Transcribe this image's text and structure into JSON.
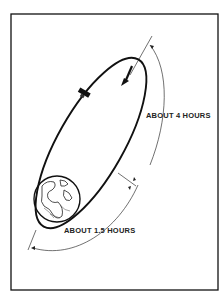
{
  "diagram": {
    "labels": {
      "long_arc": "ABOUT 4 HOURS",
      "short_arc": "ABOUT 1.5 HOURS"
    },
    "elements": {
      "central_body": "earth",
      "vehicle": "spacecraft",
      "orbit": "elliptical-orbit",
      "direction": "arrow-down-left"
    },
    "colors": {
      "ink": "#111111",
      "background": "#ffffff"
    }
  }
}
